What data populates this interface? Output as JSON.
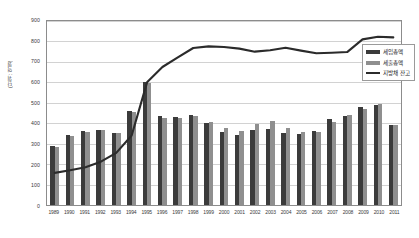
{
  "chart_data": {
    "type": "bar",
    "title": "",
    "xlabel": "",
    "ylabel": "(단위 : 억원)",
    "ylim": [
      0,
      900
    ],
    "ytick_step": 100,
    "yticks": [
      "900",
      "800",
      "700",
      "600",
      "500",
      "400",
      "300",
      "200",
      "100",
      "0"
    ],
    "grid": true,
    "legend_position": "right-inside",
    "categories": [
      "1989",
      "1990",
      "1991",
      "1992",
      "1993",
      "1994",
      "1995",
      "1996",
      "1997",
      "1998",
      "1999",
      "2000",
      "2001",
      "2002",
      "2003",
      "2004",
      "2005",
      "2006",
      "2007",
      "2008",
      "2009",
      "2010",
      "2011"
    ],
    "series": [
      {
        "name": "세입총액",
        "kind": "bar",
        "color": "#3b3b3b",
        "values": [
          288,
          341,
          362,
          368,
          352,
          458,
          600,
          434,
          430,
          440,
          402,
          358,
          341,
          368,
          372,
          353,
          345,
          363,
          423,
          433,
          477,
          488,
          391
        ]
      },
      {
        "name": "세출총액",
        "kind": "bar",
        "color": "#8f8f8f",
        "values": [
          285,
          337,
          358,
          365,
          350,
          455,
          597,
          428,
          428,
          437,
          405,
          378,
          361,
          398,
          410,
          376,
          358,
          358,
          408,
          440,
          470,
          492,
          392
        ]
      },
      {
        "name": "지방채 잔고",
        "kind": "line",
        "color": "#2b2b2b",
        "values": [
          157,
          170,
          185,
          212,
          255,
          340,
          600,
          675,
          722,
          768,
          776,
          773,
          765,
          750,
          757,
          769,
          755,
          742,
          745,
          748,
          810,
          823,
          820
        ]
      }
    ]
  },
  "legend": {
    "entries": [
      {
        "label": "세입총액",
        "swatch": "bar-dark"
      },
      {
        "label": "세출총액",
        "swatch": "bar-gray"
      },
      {
        "label": "지방채 잔고",
        "swatch": "line-dark"
      }
    ]
  }
}
